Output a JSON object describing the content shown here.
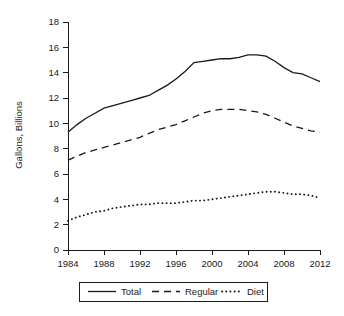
{
  "chart_data": {
    "type": "line",
    "title": "",
    "xlabel": "",
    "ylabel": "Gallons, Billions",
    "xlim": [
      1984,
      2012
    ],
    "ylim": [
      0,
      18
    ],
    "xticks": [
      1984,
      1988,
      1992,
      1996,
      2000,
      2004,
      2008,
      2012
    ],
    "yticks": [
      0,
      2,
      4,
      6,
      8,
      10,
      12,
      14,
      16,
      18
    ],
    "grid": false,
    "legend_position": "below-axes",
    "x": [
      1984,
      1985,
      1986,
      1987,
      1988,
      1989,
      1990,
      1991,
      1992,
      1993,
      1994,
      1995,
      1996,
      1997,
      1998,
      1999,
      2000,
      2001,
      2002,
      2003,
      2004,
      2005,
      2006,
      2007,
      2008,
      2009,
      2010,
      2011,
      2012
    ],
    "series": [
      {
        "name": "Total",
        "style": "solid",
        "values": [
          9.3,
          9.9,
          10.4,
          10.8,
          11.2,
          11.4,
          11.6,
          11.8,
          12.0,
          12.2,
          12.6,
          13.0,
          13.5,
          14.1,
          14.8,
          14.9,
          15.0,
          15.1,
          15.1,
          15.2,
          15.4,
          15.4,
          15.3,
          14.9,
          14.4,
          14.0,
          13.9,
          13.6,
          13.3
        ]
      },
      {
        "name": "Regular",
        "style": "dashed",
        "values": [
          7.1,
          7.4,
          7.7,
          7.9,
          8.1,
          8.3,
          8.5,
          8.7,
          8.9,
          9.2,
          9.5,
          9.7,
          9.9,
          10.2,
          10.5,
          10.8,
          11.0,
          11.1,
          11.1,
          11.1,
          11.0,
          10.9,
          10.7,
          10.4,
          10.1,
          9.8,
          9.6,
          9.4,
          9.3
        ]
      },
      {
        "name": "Diet",
        "style": "dotted",
        "values": [
          2.3,
          2.6,
          2.8,
          3.0,
          3.1,
          3.3,
          3.4,
          3.5,
          3.6,
          3.6,
          3.7,
          3.7,
          3.7,
          3.8,
          3.9,
          3.9,
          4.0,
          4.1,
          4.2,
          4.3,
          4.4,
          4.5,
          4.6,
          4.6,
          4.5,
          4.4,
          4.4,
          4.3,
          4.1
        ]
      }
    ]
  },
  "legend": {
    "items": [
      {
        "label": "Total",
        "style": "solid"
      },
      {
        "label": "Regular",
        "style": "dashed"
      },
      {
        "label": "Diet",
        "style": "dotted"
      }
    ]
  },
  "colors": {
    "ink": "#1a1a1a",
    "background": "#ffffff"
  }
}
